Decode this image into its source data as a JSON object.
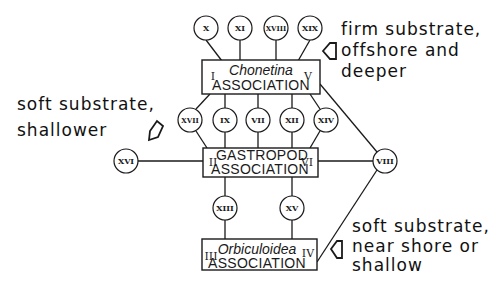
{
  "associations": [
    {
      "genus": "Chonetina",
      "label": "ASSOCIATION",
      "left_numeral": "I",
      "right_numeral": "V"
    },
    {
      "genus": "",
      "title": "GASTROPOD",
      "label": "ASSOCIATION",
      "left_numeral": "II",
      "right_numeral": "VI"
    },
    {
      "genus": "Orbiculoidea",
      "label": "ASSOCIATION",
      "left_numeral": "III",
      "right_numeral": "IV"
    }
  ],
  "nodes": {
    "top": [
      "X",
      "XI",
      "XVIII",
      "XIX"
    ],
    "middle": [
      "XVII",
      "IX",
      "VII",
      "XII",
      "XIV"
    ],
    "bottom": [
      "XIII",
      "XV"
    ],
    "left": "XVI",
    "right": "VIII"
  },
  "annotations": {
    "firm": [
      "firm substrate,",
      "offshore and",
      "deeper"
    ],
    "soft_shallower": [
      "soft substrate,",
      "shallower"
    ],
    "soft_nearshore": [
      "soft substrate,",
      "near shore or",
      "shallow"
    ]
  },
  "colors": {
    "ink": "#1a1a1a",
    "background": "#ffffff"
  }
}
